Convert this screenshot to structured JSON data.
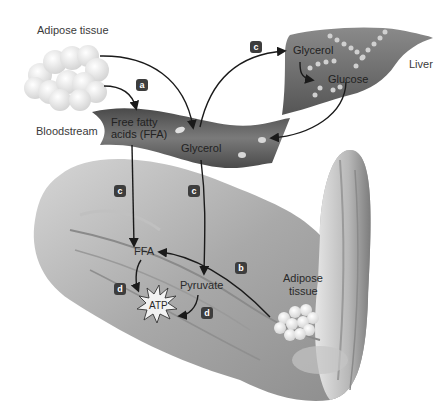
{
  "labels": {
    "adipose_tissue_top": "Adipose tissue",
    "bloodstream": "Bloodstream",
    "ffa_line1": "Free fatty",
    "ffa_line2": "acids (FFA)",
    "glycerol_blood": "Glycerol",
    "glycerol_liver": "Glycerol",
    "glucose": "Glucose",
    "liver": "Liver",
    "ffa_muscle": "FFA",
    "pyruvate": "Pyruvate",
    "atp": "ATP",
    "adipose_arm_line1": "Adipose",
    "adipose_arm_line2": "tissue"
  },
  "badges": {
    "a": "a",
    "b": "b",
    "c_liver": "c",
    "c_ffa": "c",
    "c_glycerol": "c",
    "d_ffa": "d",
    "d_pyruvate": "d"
  },
  "colors": {
    "background": "#ffffff",
    "badge": "#3d3d3d",
    "arrow": "#1a1a1a",
    "blood_vessel": "#6a6a6a",
    "liver": "#707070",
    "muscle": "#a8a8a8",
    "fat_cell": "#e6e6e6"
  }
}
